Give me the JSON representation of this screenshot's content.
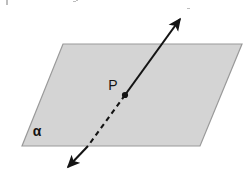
{
  "figure": {
    "background_color": "#ffffff",
    "width": 249,
    "height": 189
  },
  "plane": {
    "name": "alpha",
    "label": "α",
    "label_x": 37,
    "label_y": 136,
    "fill_color": "#d4d4d4",
    "stroke_color": "#9a9a9a",
    "stroke_width": 1.2,
    "points": "63,44 242,44 200,146 22,146",
    "vertices": [
      {
        "name": "top-left",
        "x": 63,
        "y": 44
      },
      {
        "name": "top-right",
        "x": 242,
        "y": 44
      },
      {
        "name": "bottom-right",
        "x": 200,
        "y": 146
      },
      {
        "name": "bottom-left",
        "x": 22,
        "y": 146
      }
    ]
  },
  "line": {
    "name": "line-through-plane",
    "color": "#141414",
    "stroke_width": 2.1,
    "dash_pattern": "5,4",
    "upper_segment": {
      "x1": 125,
      "y1": 95,
      "x2": 180,
      "y2": 19
    },
    "hidden_segment": {
      "x1": 125,
      "y1": 95,
      "x2": 88,
      "y2": 146
    },
    "lower_segment": {
      "x1": 88,
      "y1": 146,
      "x2": 68,
      "y2": 167
    },
    "arrow_up": {
      "tip_x": 186,
      "tip_y": 12,
      "angle": -54
    },
    "arrow_down": {
      "tip_x": 62,
      "tip_y": 175,
      "angle": 126
    }
  },
  "point": {
    "name": "P",
    "label": "P",
    "x": 125,
    "y": 95,
    "radius": 3.1,
    "color": "#141414",
    "label_x": 113,
    "label_y": 90
  },
  "specks": [
    {
      "x": 6,
      "y": 0,
      "w": 2,
      "h": 5
    },
    {
      "x": 73,
      "y": 1,
      "w": 3,
      "h": 1
    },
    {
      "x": 76,
      "y": 0,
      "w": 2,
      "h": 1
    },
    {
      "x": 187,
      "y": 8,
      "w": 3,
      "h": 1
    }
  ]
}
